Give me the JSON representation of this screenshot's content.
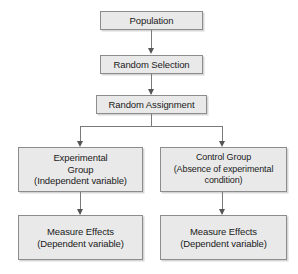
{
  "diagram": {
    "style": {
      "box_fill": "#e9e9e9",
      "box_border": "#8c8c8c",
      "connector": "#7a7a7a",
      "arrowhead": "#555555",
      "background": "#ffffff",
      "text": "#1a1a1a"
    },
    "nodes": [
      {
        "id": "population",
        "lines": [
          "Population"
        ]
      },
      {
        "id": "random-selection",
        "lines": [
          "Random Selection"
        ]
      },
      {
        "id": "random-assignment",
        "lines": [
          "Random Assignment"
        ]
      },
      {
        "id": "experimental-group",
        "lines": [
          "Experimental",
          "Group",
          "(Independent variable)"
        ]
      },
      {
        "id": "control-group",
        "lines": [
          "Control Group",
          "(Absence of experimental",
          "condition)"
        ]
      },
      {
        "id": "measure-effects-left",
        "lines": [
          "Measure Effects",
          "(Dependent variable)"
        ]
      },
      {
        "id": "measure-effects-right",
        "lines": [
          "Measure Effects",
          "(Dependent variable)"
        ]
      }
    ],
    "edges": [
      {
        "id": "population-to-random-selection",
        "from": "population",
        "to": "random-selection"
      },
      {
        "id": "random-selection-to-random-assignment",
        "from": "random-selection",
        "to": "random-assignment"
      },
      {
        "id": "random-assignment-to-experimental-group",
        "from": "random-assignment",
        "to": "experimental-group"
      },
      {
        "id": "random-assignment-to-control-group",
        "from": "random-assignment",
        "to": "control-group"
      },
      {
        "id": "experimental-group-to-measure-effects-left",
        "from": "experimental-group",
        "to": "measure-effects-left"
      },
      {
        "id": "control-group-to-measure-effects-right",
        "from": "control-group",
        "to": "measure-effects-right"
      }
    ]
  }
}
